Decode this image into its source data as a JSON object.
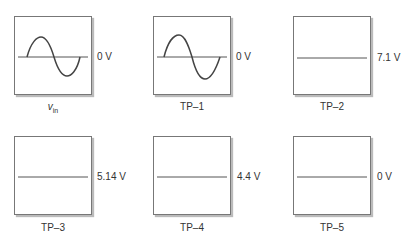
{
  "panels": [
    {
      "label": "v",
      "label_sub": "in",
      "value": "0 V",
      "waveform": "sine"
    },
    {
      "label": "TP–1",
      "value": "0 V",
      "waveform": "sine"
    },
    {
      "label": "TP–2",
      "value": "7.1 V",
      "waveform": "dc"
    },
    {
      "label": "TP–3",
      "value": "5.14 V",
      "waveform": "dc"
    },
    {
      "label": "TP–4",
      "value": "4.4 V",
      "waveform": "dc"
    },
    {
      "label": "TP–5",
      "value": "0 V",
      "waveform": "dc"
    }
  ]
}
